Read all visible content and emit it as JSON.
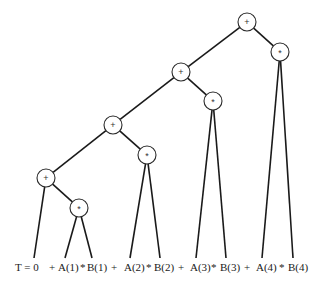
{
  "diagram": {
    "type": "expression-tree",
    "nodes": [
      {
        "id": "p4",
        "op": "+",
        "x": 247,
        "y": 22
      },
      {
        "id": "m4",
        "op": "*",
        "x": 280,
        "y": 52
      },
      {
        "id": "p3",
        "op": "+",
        "x": 181,
        "y": 72
      },
      {
        "id": "m3",
        "op": "*",
        "x": 213,
        "y": 101
      },
      {
        "id": "p2",
        "op": "+",
        "x": 113,
        "y": 125
      },
      {
        "id": "m2",
        "op": "*",
        "x": 147,
        "y": 155
      },
      {
        "id": "p1",
        "op": "+",
        "x": 46,
        "y": 178
      },
      {
        "id": "m1",
        "op": "*",
        "x": 79,
        "y": 208
      }
    ],
    "edges": [
      [
        "p4",
        "p3"
      ],
      [
        "p4",
        "m4"
      ],
      [
        "p3",
        "p2"
      ],
      [
        "p3",
        "m3"
      ],
      [
        "p2",
        "p1"
      ],
      [
        "p2",
        "m2"
      ],
      [
        "p1",
        "leaf_T"
      ],
      [
        "p1",
        "m1"
      ],
      [
        "m1",
        "leaf_A1"
      ],
      [
        "m1",
        "leaf_B1"
      ],
      [
        "m2",
        "leaf_A2"
      ],
      [
        "m2",
        "leaf_B2"
      ],
      [
        "m3",
        "leaf_A3"
      ],
      [
        "m3",
        "leaf_B3"
      ],
      [
        "m4",
        "leaf_A4"
      ],
      [
        "m4",
        "leaf_B4"
      ]
    ],
    "leaves": [
      {
        "id": "leaf_T",
        "x": 34,
        "y": 258
      },
      {
        "id": "leaf_A1",
        "x": 65,
        "y": 258
      },
      {
        "id": "leaf_B1",
        "x": 92,
        "y": 258
      },
      {
        "id": "leaf_A2",
        "x": 130,
        "y": 258
      },
      {
        "id": "leaf_B2",
        "x": 160,
        "y": 258
      },
      {
        "id": "leaf_A3",
        "x": 196,
        "y": 258
      },
      {
        "id": "leaf_B3",
        "x": 226,
        "y": 258
      },
      {
        "id": "leaf_A4",
        "x": 262,
        "y": 258
      },
      {
        "id": "leaf_B4",
        "x": 293,
        "y": 258
      }
    ],
    "labels": [
      {
        "text": "T = 0",
        "x": 15
      },
      {
        "text": "+",
        "x": 49
      },
      {
        "text": "A(1)",
        "x": 58
      },
      {
        "text": "*",
        "x": 80
      },
      {
        "text": "B(1)",
        "x": 87
      },
      {
        "text": "+",
        "x": 111
      },
      {
        "text": "A(2)",
        "x": 124
      },
      {
        "text": "*",
        "x": 146
      },
      {
        "text": "B(2)",
        "x": 154
      },
      {
        "text": "+",
        "x": 178
      },
      {
        "text": "A(3)",
        "x": 190
      },
      {
        "text": "*",
        "x": 211
      },
      {
        "text": "B(3)",
        "x": 220
      },
      {
        "text": "+",
        "x": 244
      },
      {
        "text": "A(4)",
        "x": 256
      },
      {
        "text": "*",
        "x": 279
      },
      {
        "text": "B(4)",
        "x": 288
      }
    ],
    "label_y": 267,
    "node_radius": 9
  }
}
